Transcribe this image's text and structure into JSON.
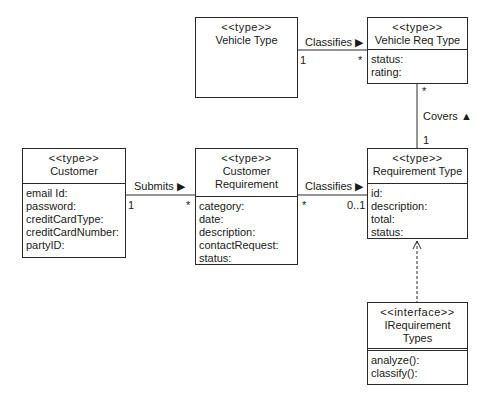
{
  "classes": {
    "vehicle_type": {
      "stereotype": "<<type>>",
      "name": "Vehicle Type",
      "attributes": []
    },
    "vehicle_req_type": {
      "stereotype": "<<type>>",
      "name": "Vehicle Req Type",
      "attributes": [
        "status:",
        "rating:"
      ]
    },
    "customer": {
      "stereotype": "<<type>>",
      "name": "Customer",
      "attributes": [
        "email Id:",
        "password:",
        "creditCardType:",
        "creditCardNumber:",
        "partyID:"
      ]
    },
    "customer_requirement": {
      "stereotype": "<<type>>",
      "name_line1": "Customer",
      "name_line2": "Requirement",
      "attributes": [
        "category:",
        "date:",
        "description:",
        "contactRequest:",
        "status:"
      ]
    },
    "requirement_type": {
      "stereotype": "<<type>>",
      "name": "Requirement Type",
      "attributes": [
        "id:",
        "description:",
        "total:",
        "status:"
      ]
    },
    "irequirement_types": {
      "stereotype": "<<interface>>",
      "name_line1": "IRequirement",
      "name_line2": "Types",
      "operations": [
        "analyze():",
        "classify():"
      ]
    }
  },
  "associations": {
    "vehicle_classifies": {
      "label": "Classifies ▶",
      "source_mult": "1",
      "target_mult": "*"
    },
    "covers": {
      "label": "Covers ▲",
      "source_mult": "*",
      "target_mult": "1"
    },
    "submits": {
      "label": "Submits ▶",
      "source_mult": "1",
      "target_mult": "*"
    },
    "req_classifies": {
      "label": "Classifies ▶",
      "source_mult": "*",
      "target_mult": "0..1"
    }
  },
  "colors": {
    "line": "#2a2a2a",
    "background": "#ffffff"
  }
}
